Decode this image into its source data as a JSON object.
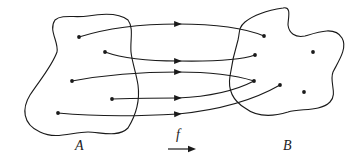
{
  "diagram": {
    "type": "function-mapping",
    "stroke_color": "#1a1a1a",
    "sets": [
      {
        "id": "A",
        "label": "A",
        "label_pos": [
          75,
          146
        ]
      },
      {
        "id": "B",
        "label": "B",
        "label_pos": [
          283,
          146
        ]
      }
    ],
    "function_label": "f",
    "domain_points": [
      [
        79,
        37
      ],
      [
        105,
        52
      ],
      [
        72,
        81
      ],
      [
        112,
        99
      ],
      [
        58,
        113
      ]
    ],
    "codomain_points": [
      [
        264,
        36
      ],
      [
        255,
        55
      ],
      [
        313,
        52
      ],
      [
        254,
        81
      ],
      [
        280,
        85
      ],
      [
        304,
        92
      ]
    ],
    "mappings": [
      {
        "from": 0,
        "to": 0
      },
      {
        "from": 1,
        "to": 1
      },
      {
        "from": 2,
        "to": 3
      },
      {
        "from": 3,
        "to": 3
      },
      {
        "from": 4,
        "to": 4
      }
    ]
  }
}
